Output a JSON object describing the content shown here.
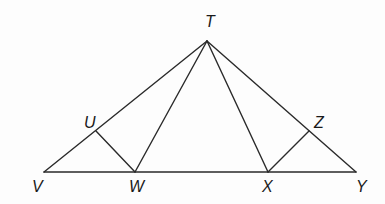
{
  "diagram": {
    "type": "geometry-figure",
    "points": {
      "T": {
        "label": "T",
        "x": 207,
        "y": 41,
        "lx": 205,
        "ly": 27
      },
      "U": {
        "label": "U",
        "x": 96,
        "y": 131,
        "lx": 84,
        "ly": 128
      },
      "V": {
        "label": "V",
        "x": 44,
        "y": 172,
        "lx": 32,
        "ly": 192
      },
      "W": {
        "label": "W",
        "x": 135,
        "y": 172,
        "lx": 129,
        "ly": 192
      },
      "X": {
        "label": "X",
        "x": 268,
        "y": 172,
        "lx": 262,
        "ly": 192
      },
      "Y": {
        "label": "Y",
        "x": 356,
        "y": 172,
        "lx": 356,
        "ly": 192
      },
      "Z": {
        "label": "Z",
        "x": 309,
        "y": 131,
        "lx": 314,
        "ly": 128
      }
    },
    "segments": [
      [
        "T",
        "V"
      ],
      [
        "T",
        "Y"
      ],
      [
        "V",
        "Y"
      ],
      [
        "T",
        "W"
      ],
      [
        "T",
        "X"
      ],
      [
        "U",
        "W"
      ],
      [
        "X",
        "Z"
      ]
    ],
    "line_color": "#2a2a2a"
  }
}
